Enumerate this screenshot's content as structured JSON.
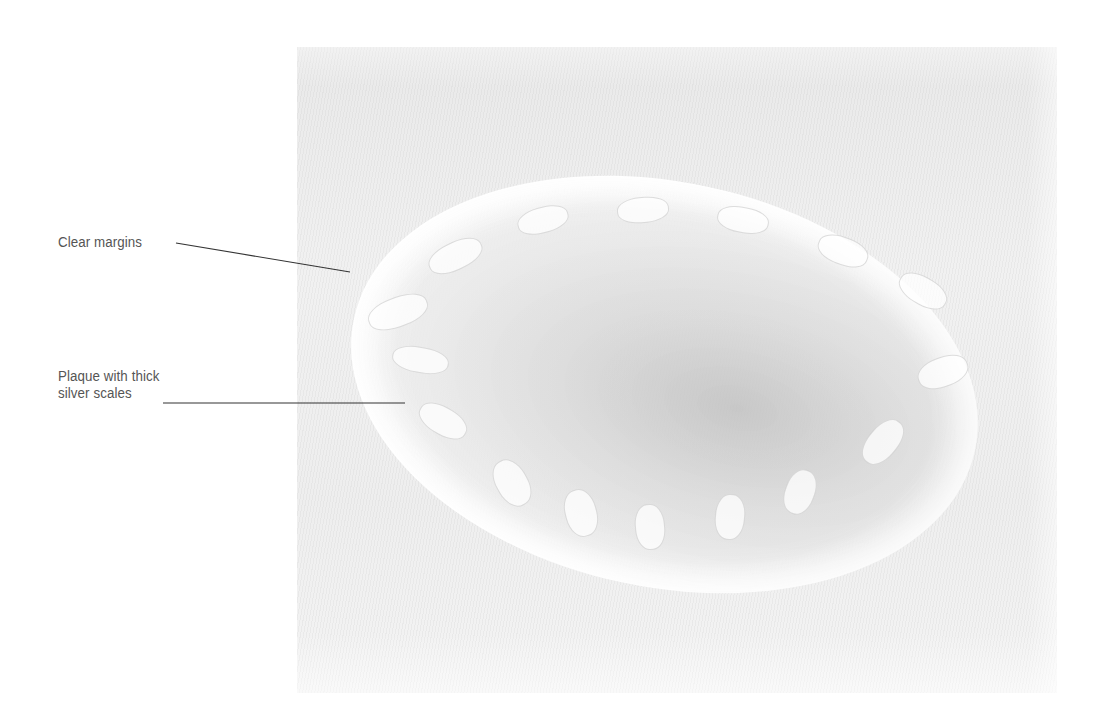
{
  "figure": {
    "annotations": [
      {
        "id": "clear-margins",
        "label_lines": [
          "Clear margins"
        ],
        "label_position": {
          "x": 58,
          "y": 233
        },
        "leader_line": {
          "x1": 176,
          "y1": 243,
          "x2": 350,
          "y2": 272
        }
      },
      {
        "id": "plaque-scales",
        "label_lines": [
          "Plaque with thick",
          "silver scales"
        ],
        "label_position": {
          "x": 58,
          "y": 367
        },
        "leader_line": {
          "x1": 163,
          "y1": 403,
          "x2": 405,
          "y2": 403
        }
      }
    ],
    "colors": {
      "label_text": "#555555",
      "leader_line": "#333333",
      "background": "#ffffff",
      "photo_base": "#eeeeee"
    }
  }
}
